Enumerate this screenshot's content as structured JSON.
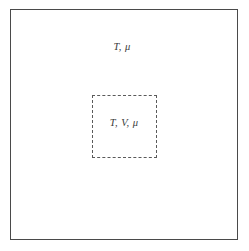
{
  "figure": {
    "type": "thermodynamic-system-diagram",
    "background_color": "#ffffff",
    "outer_box": {
      "name": "reservoir",
      "border_style": "solid",
      "border_color": "#4a4a4a",
      "label": "T, μ"
    },
    "inner_box": {
      "name": "open-subsystem",
      "border_style": "dashed",
      "border_color": "#5a5a5a",
      "label": "T, V, μ"
    }
  }
}
